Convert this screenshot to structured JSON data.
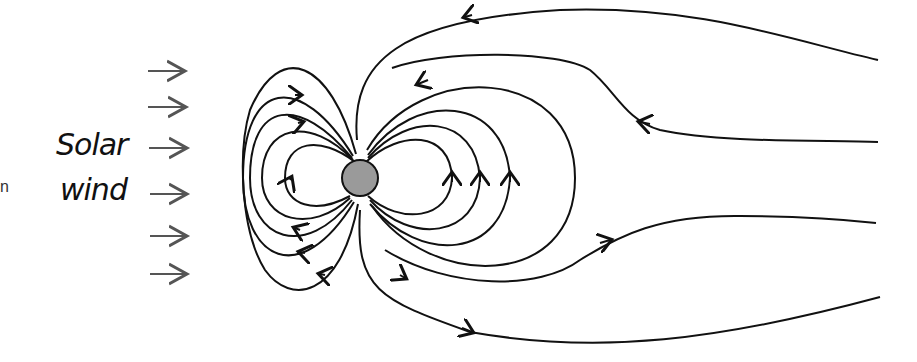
{
  "labels": {
    "solar_line1": "Solar",
    "solar_line2": "wind",
    "edge_fragment": "n"
  },
  "colors": {
    "line": "#111111",
    "earth_fill": "#9a9a9a",
    "wind_arrow": "#555555",
    "background": "#ffffff"
  },
  "diagram": {
    "earth": {
      "cx": 360,
      "cy": 178,
      "r": 18
    },
    "solar_wind_arrows": 6
  }
}
